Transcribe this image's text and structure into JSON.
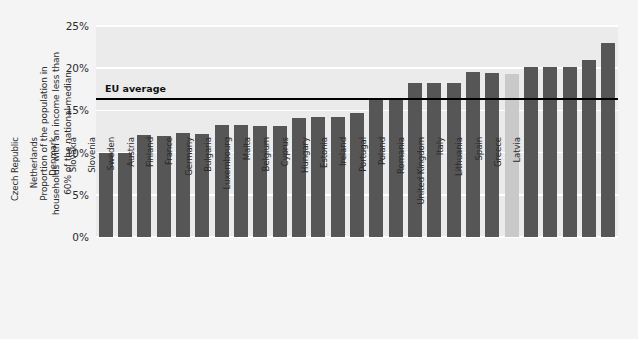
{
  "chart_data": {
    "type": "bar",
    "title": "",
    "xlabel": "",
    "ylabel": "Proportion of the population in households with an income less than 60% of the national median",
    "ylabel_lines": [
      "Proportion of the population in",
      "households with an income less than",
      "60% of the national median"
    ],
    "ylim": [
      0,
      25
    ],
    "yticks": [
      0,
      5,
      10,
      15,
      20,
      25
    ],
    "ytick_labels": [
      "0%",
      "5%",
      "10%",
      "15%",
      "20%",
      "25%"
    ],
    "grid": true,
    "legend": "none",
    "categories": [
      "Czech Republic",
      "Netherlands",
      "Denmark",
      "Slovakia",
      "Slovenia",
      "Sweden",
      "Austria",
      "Finland",
      "France",
      "Germany",
      "Bulgaria",
      "Luxembourg",
      "Malta",
      "Belgium",
      "Cyprus",
      "Hungary",
      "Estonia",
      "Ireland",
      "Portugal",
      "Poland",
      "Romania",
      "United Kingdom",
      "Italy",
      "Lithuania",
      "Spain",
      "Greece",
      "Latvia"
    ],
    "values": [
      10.0,
      10.0,
      12.1,
      12.0,
      12.3,
      12.2,
      13.3,
      13.3,
      13.1,
      13.2,
      14.1,
      14.2,
      14.2,
      14.7,
      16.2,
      16.3,
      18.3,
      18.2,
      18.3,
      19.5,
      19.4,
      19.3,
      20.1,
      20.2,
      20.1,
      21.0,
      23.0
    ],
    "highlight_category": "United Kingdom",
    "annotations": [
      {
        "name": "eu-average",
        "label": "EU average",
        "value": 16.3
      }
    ],
    "colors": {
      "bar": "#565656",
      "bar_highlight": "#c9c9c9",
      "plot_background": "#ebebeb",
      "page_background": "#f4f4f4",
      "gridline": "#ffffff",
      "annotation_line": "#000000",
      "text": "#2b2b2b"
    }
  }
}
